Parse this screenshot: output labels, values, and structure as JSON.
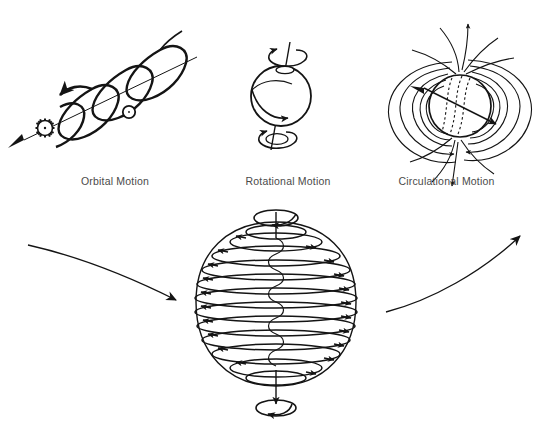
{
  "figure": {
    "title_visible": false,
    "background_color": "#ffffff",
    "ink_color": "#141414",
    "caption_color": "#4a4a4a"
  },
  "panels": [
    {
      "id": "orbital",
      "label": "Orbital Motion",
      "icons": [
        "sun-icon",
        "planet-icon",
        "helix-path-icon",
        "direction-arrow-icon"
      ],
      "description_visible": false
    },
    {
      "id": "rotational",
      "label": "Rotational Motion",
      "icons": [
        "sphere-icon",
        "spin-axis-icon",
        "equator-arrow-icon",
        "spin-loop-icon"
      ],
      "description_visible": false
    },
    {
      "id": "circulational",
      "label": "Circulational Motion",
      "icons": [
        "sphere-icon",
        "dipole-field-icon",
        "tilted-axis-icon"
      ],
      "description_visible": false
    }
  ],
  "main_diagram": {
    "id": "combined-motion",
    "label_visible": false,
    "icons": [
      "toroid-coil-icon",
      "vertical-axis-icon",
      "top-spin-loop-icon",
      "bottom-spin-loop-icon",
      "incoming-trajectory-arrow-icon",
      "outgoing-trajectory-arrow-icon"
    ],
    "coil_ring_count": 12,
    "axis_orientation": "vertical"
  }
}
